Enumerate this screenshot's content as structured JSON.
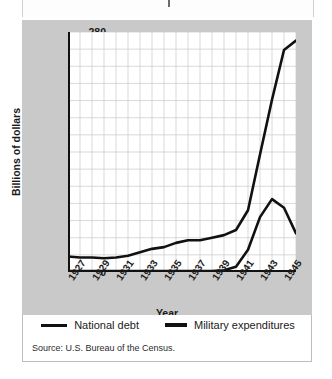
{
  "chart_data": {
    "type": "line",
    "title": "",
    "xlabel": "Year",
    "ylabel": "Billions of dollars",
    "xlim": [
      1927,
      1946
    ],
    "ylim": [
      0,
      280
    ],
    "ytick_step": 20,
    "grid": true,
    "legend_position": "bottom",
    "x": [
      1927,
      1928,
      1929,
      1930,
      1931,
      1932,
      1933,
      1934,
      1935,
      1936,
      1937,
      1938,
      1939,
      1940,
      1941,
      1942,
      1943,
      1944,
      1945,
      1946
    ],
    "yticks": [
      0,
      20,
      40,
      60,
      80,
      100,
      120,
      140,
      160,
      180,
      200,
      220,
      240,
      260,
      280
    ],
    "xticks": [
      "1927",
      "1929",
      "1931",
      "1933",
      "1935",
      "1937",
      "1939",
      "1941",
      "1943",
      "1945"
    ],
    "series": [
      {
        "name": "National debt",
        "color": "#111111",
        "values": [
          18,
          17,
          17,
          16,
          17,
          19,
          23,
          27,
          29,
          34,
          37,
          37,
          40,
          43,
          49,
          72,
          137,
          201,
          259,
          270
        ]
      },
      {
        "name": "Military expenditures",
        "color": "#111111",
        "values": [
          1,
          1,
          1,
          1,
          1,
          1,
          1,
          1,
          1,
          1,
          1,
          1,
          1,
          2,
          6,
          26,
          64,
          85,
          75,
          45
        ]
      }
    ],
    "source": "Source: U.S. Bureau of the Census."
  },
  "legend": {
    "items": [
      {
        "label": "National debt",
        "swatch": "thin-line-swatch"
      },
      {
        "label": "Military expenditures",
        "swatch": "thick-line-swatch"
      }
    ]
  },
  "axes": {
    "x_title": "Year",
    "y_title": "Billions of dollars"
  },
  "colors": {
    "panel_background": "#c9c9c9",
    "plot_background": "#ffffff",
    "grid": "#c8c8c8",
    "line": "#111111",
    "text": "#1a1a1a"
  }
}
